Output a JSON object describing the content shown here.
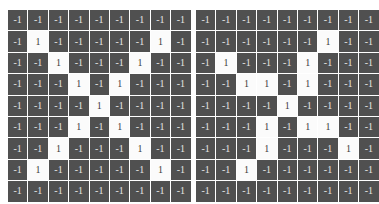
{
  "page": {
    "background_color": "#ffffff",
    "negative_cell_color": "#505050",
    "positive_cell_color": "#fbfbfb",
    "negative_text_color": "#e6e6e6",
    "positive_text_color": "#3c3c3c",
    "negative_label": "-1",
    "positive_label": "1"
  },
  "chart_data": {
    "type": "heatmap",
    "title": "",
    "xlabel": "",
    "ylabel": "",
    "grid": true,
    "legend": "none",
    "value_labels": {
      "-1": "-1",
      "1": "1"
    },
    "colormap": {
      "-1": "#505050",
      "1": "#fbfbfb"
    },
    "panels": [
      {
        "name": "left-matrix",
        "rows": 9,
        "cols": 9,
        "values": [
          [
            -1,
            -1,
            -1,
            -1,
            -1,
            -1,
            -1,
            -1,
            -1
          ],
          [
            -1,
            1,
            -1,
            -1,
            -1,
            -1,
            -1,
            1,
            -1
          ],
          [
            -1,
            -1,
            1,
            -1,
            -1,
            -1,
            1,
            -1,
            -1
          ],
          [
            -1,
            -1,
            -1,
            1,
            -1,
            1,
            -1,
            -1,
            -1
          ],
          [
            -1,
            -1,
            -1,
            -1,
            1,
            -1,
            -1,
            -1,
            -1
          ],
          [
            -1,
            -1,
            -1,
            1,
            -1,
            1,
            -1,
            -1,
            -1
          ],
          [
            -1,
            -1,
            1,
            -1,
            -1,
            -1,
            1,
            -1,
            -1
          ],
          [
            -1,
            1,
            -1,
            -1,
            -1,
            -1,
            -1,
            1,
            -1
          ],
          [
            -1,
            -1,
            -1,
            -1,
            -1,
            -1,
            -1,
            -1,
            -1
          ]
        ]
      },
      {
        "name": "right-matrix",
        "rows": 9,
        "cols": 9,
        "values": [
          [
            -1,
            -1,
            -1,
            -1,
            -1,
            -1,
            -1,
            -1,
            -1
          ],
          [
            -1,
            -1,
            -1,
            -1,
            -1,
            -1,
            1,
            -1,
            -1
          ],
          [
            -1,
            1,
            -1,
            -1,
            -1,
            1,
            -1,
            -1,
            -1
          ],
          [
            -1,
            -1,
            1,
            1,
            -1,
            1,
            -1,
            -1,
            -1
          ],
          [
            -1,
            -1,
            -1,
            -1,
            1,
            -1,
            -1,
            -1,
            -1
          ],
          [
            -1,
            -1,
            -1,
            1,
            -1,
            1,
            1,
            -1,
            -1
          ],
          [
            -1,
            -1,
            -1,
            1,
            -1,
            -1,
            -1,
            1,
            -1
          ],
          [
            -1,
            -1,
            1,
            -1,
            -1,
            -1,
            -1,
            -1,
            -1
          ],
          [
            -1,
            -1,
            -1,
            -1,
            -1,
            -1,
            -1,
            -1,
            -1
          ]
        ]
      }
    ]
  }
}
